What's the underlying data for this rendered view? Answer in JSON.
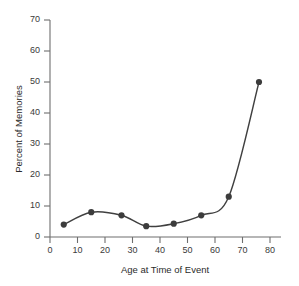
{
  "chart_data": {
    "type": "line",
    "title": "",
    "xlabel": "Age at Time of Event",
    "ylabel": "Percent of Memories",
    "xlim": [
      0,
      83
    ],
    "ylim": [
      0,
      73
    ],
    "xticks": [
      0,
      10,
      20,
      30,
      40,
      50,
      60,
      70,
      80
    ],
    "ytick_labels": [
      "0",
      "10",
      "20",
      "30",
      "40",
      "50",
      "60",
      "70"
    ],
    "xtick_labels": [
      "0",
      "10",
      "20",
      "30",
      "40",
      "50",
      "60",
      "70",
      "80"
    ],
    "yticks": [
      0,
      10,
      20,
      30,
      40,
      50,
      60,
      70
    ],
    "grid": false,
    "legend": null,
    "markers": true,
    "series": [
      {
        "name": "Percent of Memories",
        "color": "#404040",
        "x": [
          5,
          15,
          26,
          35,
          45,
          55,
          65,
          76
        ],
        "values": [
          4,
          8,
          7,
          3.5,
          4.3,
          7,
          13,
          50
        ],
        "points": [
          {
            "x": 5,
            "y": 4
          },
          {
            "x": 15,
            "y": 8
          },
          {
            "x": 26,
            "y": 7
          },
          {
            "x": 35,
            "y": 3.5
          },
          {
            "x": 45,
            "y": 4.3
          },
          {
            "x": 55,
            "y": 7
          },
          {
            "x": 65,
            "y": 13
          },
          {
            "x": 76,
            "y": 50
          }
        ]
      }
    ]
  },
  "style": {
    "line_color": "#404040",
    "marker_color": "#3c3c3c",
    "axis_color": "#6e6e6e",
    "text_color": "#2b2b2b",
    "background": "#ffffff"
  }
}
